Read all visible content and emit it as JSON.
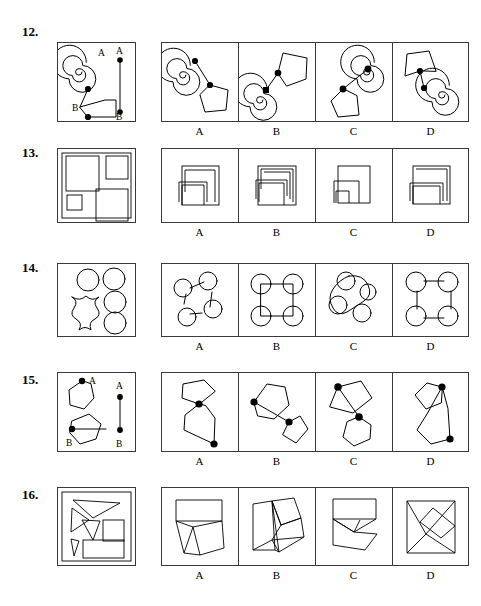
{
  "page": {
    "width": 481,
    "height": 606,
    "background": "#ffffff",
    "ink": "#000000",
    "border": "#3a3a3a",
    "type": "printed-test-page"
  },
  "option_letters": [
    "A",
    "B",
    "C",
    "D"
  ],
  "items": [
    {
      "number": "12.",
      "stimulus": {
        "name": "spiral-and-pentagon-with-AB-segment",
        "labels": [
          "A",
          "A",
          "B",
          "B"
        ]
      },
      "options": [
        {
          "letter": "A",
          "name": "spiral-upper-left-pentagon-lower-right"
        },
        {
          "letter": "B",
          "name": "spiral-lower-left-pentagon-upper-right"
        },
        {
          "letter": "C",
          "name": "spiral-upper-right-pentagon-lower-left"
        },
        {
          "letter": "D",
          "name": "pentagon-upper-left-spiral-lower-right"
        }
      ]
    },
    {
      "number": "13.",
      "stimulus": {
        "name": "four-nested-rectangles-in-frame",
        "labels": []
      },
      "options": [
        {
          "letter": "A",
          "name": "nested-squares-variant-a"
        },
        {
          "letter": "B",
          "name": "nested-squares-variant-b"
        },
        {
          "letter": "C",
          "name": "nested-squares-variant-c"
        },
        {
          "letter": "D",
          "name": "nested-squares-variant-d"
        }
      ]
    },
    {
      "number": "14.",
      "stimulus": {
        "name": "five-circles-and-scalloped-square",
        "labels": []
      },
      "options": [
        {
          "letter": "A",
          "name": "five-circles-ring-linked"
        },
        {
          "letter": "B",
          "name": "four-circles-on-square-outline"
        },
        {
          "letter": "C",
          "name": "five-circles-on-curved-loop"
        },
        {
          "letter": "D",
          "name": "four-circles-joined-by-straight-bars"
        }
      ]
    },
    {
      "number": "15.",
      "stimulus": {
        "name": "pentagon-and-hexagon-with-AB-segment",
        "labels": [
          "A",
          "A",
          "B",
          "B"
        ]
      },
      "options": [
        {
          "letter": "A",
          "name": "pentagon-top-hexagon-bottom-short-join"
        },
        {
          "letter": "B",
          "name": "hexagon-left-pentagon-right-long-join"
        },
        {
          "letter": "C",
          "name": "pentagon-upper-left-hexagon-lower-right"
        },
        {
          "letter": "D",
          "name": "pentagon-upper-left-hexagon-lower-overlap"
        }
      ]
    },
    {
      "number": "16.",
      "stimulus": {
        "name": "triangles-square-and-rectangle-pieces",
        "labels": []
      },
      "options": [
        {
          "letter": "A",
          "name": "assembled-figure-variant-a"
        },
        {
          "letter": "B",
          "name": "assembled-figure-variant-b"
        },
        {
          "letter": "C",
          "name": "assembled-figure-variant-c"
        },
        {
          "letter": "D",
          "name": "assembled-figure-variant-d"
        }
      ]
    }
  ]
}
